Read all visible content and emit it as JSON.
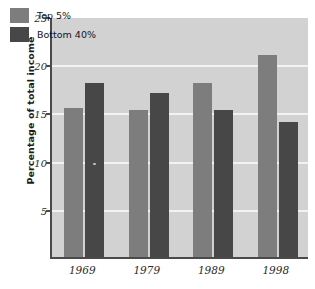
{
  "chart_data": {
    "type": "bar",
    "title": "",
    "subtitle": "",
    "xlabel": "",
    "ylabel": "Percentage of total income",
    "categories": [
      "1969",
      "1979",
      "1989",
      "1998"
    ],
    "series": [
      {
        "name": "Top 5%",
        "color": "#7d7d7d",
        "values": [
          15.5,
          15.2,
          18.0,
          21.0
        ]
      },
      {
        "name": "Bottom 40%",
        "color": "#474747",
        "values": [
          18.0,
          17.0,
          15.2,
          14.0
        ]
      }
    ],
    "ylim": [
      0,
      25
    ],
    "yticks": [
      5,
      10,
      15,
      20,
      25
    ],
    "ytick_labels": [
      "5",
      "10",
      "15",
      "20",
      "25"
    ],
    "grid": true,
    "grid_axis": "y",
    "grid_color": "#f2f2f2",
    "legend": [
      "Top 5%",
      "Bottom 40%"
    ],
    "legend_position": "upper left",
    "plot_background": "#d2d2d2",
    "figure_background": "#ffffff",
    "axis_color": "#4a4a4a"
  }
}
